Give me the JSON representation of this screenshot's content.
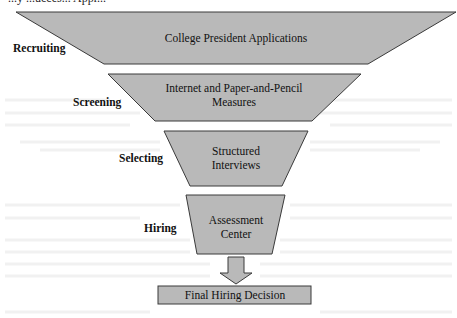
{
  "diagram": {
    "type": "funnel",
    "top_cut_text": "...y ...ucces... Appr...",
    "fill_color": "#b9b9b9",
    "stroke_color": "#333333",
    "stages": [
      {
        "label": "Recruiting",
        "content": [
          "College President Applications"
        ]
      },
      {
        "label": "Screening",
        "content": [
          "Internet and Paper-and-Pencil",
          "Measures"
        ]
      },
      {
        "label": "Selecting",
        "content": [
          "Structured",
          "Interviews"
        ]
      },
      {
        "label": "Hiring",
        "content": [
          "Assessment",
          "Center"
        ]
      }
    ],
    "outcome": {
      "label": "Final Hiring Decision"
    }
  }
}
